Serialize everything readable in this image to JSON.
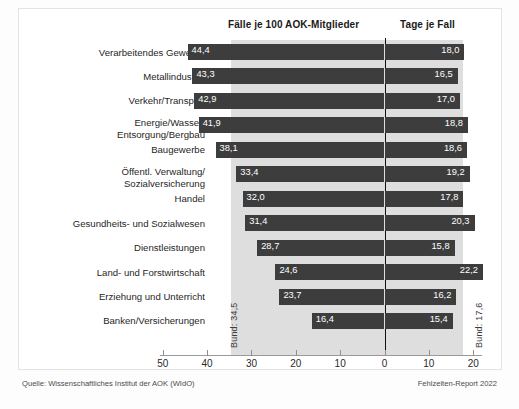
{
  "header": {
    "left_column_title": "Fälle je 100 AOK-Mitglieder",
    "right_column_title": "Tage je Fall"
  },
  "footer": {
    "source": "Quelle: Wissenschaftliches Institut der AOK (WIdO)",
    "report": "Fehlzeiten-Report 2022"
  },
  "reference_lines": {
    "left_label": "Bund: 34,5",
    "right_label": "Bund: 17,6",
    "left_value": 34.5,
    "right_value": 17.6
  },
  "axis": {
    "ticks": [
      {
        "label": "50",
        "value": -50
      },
      {
        "label": "40",
        "value": -40
      },
      {
        "label": "30",
        "value": -30
      },
      {
        "label": "20",
        "value": -20
      },
      {
        "label": "10",
        "value": -10
      },
      {
        "label": "0",
        "value": 0
      },
      {
        "label": "10",
        "value": 10
      },
      {
        "label": "20",
        "value": 20
      }
    ]
  },
  "chart_data": {
    "type": "bar",
    "subtitle": "",
    "xlabel": "",
    "ylabel": "",
    "orientation": "horizontal",
    "layout": "diverging-bidirectional",
    "grid": false,
    "legend": "none",
    "xlim": [
      -50,
      25
    ],
    "axis_ticks_left": [
      50,
      40,
      30,
      20,
      10,
      0
    ],
    "axis_ticks_right": [
      10,
      20
    ],
    "categories": [
      "Verarbeitendes Gewerbe",
      "Metallindustrie",
      "Verkehr/Transport",
      "Energie/Wasser/\nEntsorgung/Bergbau",
      "Baugewerbe",
      "Öffentl. Verwaltung/\nSozialversicherung",
      "Handel",
      "Gesundheits- und Sozialwesen",
      "Dienstleistungen",
      "Land- und Forstwirtschaft",
      "Erziehung und Unterricht",
      "Banken/Versicherungen"
    ],
    "series": [
      {
        "name": "Fälle je 100 AOK-Mitglieder",
        "direction": "left",
        "values": [
          44.4,
          43.3,
          42.9,
          41.9,
          38.1,
          33.4,
          32.0,
          31.4,
          28.7,
          24.6,
          23.7,
          16.4
        ],
        "labels": [
          "44,4",
          "43,3",
          "42,9",
          "41,9",
          "38,1",
          "33,4",
          "32,0",
          "31,4",
          "28,7",
          "24,6",
          "23,7",
          "16,4"
        ],
        "reference": 34.5,
        "reference_label": "Bund: 34,5"
      },
      {
        "name": "Tage je Fall",
        "direction": "right",
        "values": [
          18.0,
          16.5,
          17.0,
          18.8,
          18.6,
          19.2,
          17.8,
          20.3,
          15.8,
          22.2,
          16.2,
          15.4
        ],
        "labels": [
          "18,0",
          "16,5",
          "17,0",
          "18,8",
          "18,6",
          "19,2",
          "17,8",
          "20,3",
          "15,8",
          "22,2",
          "16,2",
          "15,4"
        ],
        "reference": 17.6,
        "reference_label": "Bund: 17,6"
      }
    ],
    "colors": {
      "bar": "#3d3d3d",
      "band": "#dedede",
      "zero_line": "#111111",
      "bar_label_text": "#ffffff"
    }
  }
}
